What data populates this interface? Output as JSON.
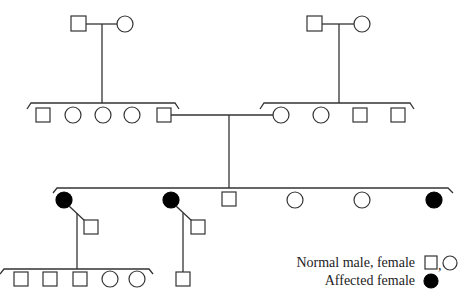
{
  "diagram": {
    "type": "pedigree",
    "generations": [
      {
        "id": "I-left",
        "members": [
          "normal male",
          "normal female"
        ]
      },
      {
        "id": "I-right",
        "members": [
          "normal male",
          "normal female"
        ]
      },
      {
        "id": "II-left-sibship",
        "members": [
          "normal male",
          "normal female",
          "normal female",
          "normal female",
          "normal male"
        ]
      },
      {
        "id": "II-right-sibship",
        "members": [
          "normal female",
          "normal female",
          "normal male",
          "normal male"
        ]
      },
      {
        "id": "III-sibship",
        "members": [
          "affected female",
          "affected female",
          "normal male",
          "normal female",
          "normal female",
          "affected female"
        ]
      },
      {
        "id": "IV-left-sibship",
        "members": [
          "normal male",
          "normal male",
          "normal male",
          "normal female",
          "normal female"
        ]
      },
      {
        "id": "IV-right",
        "members": [
          "normal male"
        ]
      }
    ]
  },
  "legend": {
    "normal_label": "Normal male, female",
    "normal_sep": ",",
    "affected_label": "Affected female"
  },
  "colors": {
    "line": "#333333",
    "affected": "#000000",
    "background": "#ffffff"
  }
}
